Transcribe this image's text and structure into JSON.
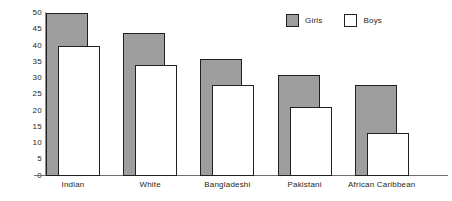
{
  "chart_data": {
    "type": "bar",
    "title": "",
    "xlabel": "",
    "ylabel": "Percentages",
    "ylim": [
      0,
      50
    ],
    "yticks": [
      0,
      5,
      10,
      15,
      20,
      25,
      30,
      35,
      40,
      45,
      50
    ],
    "grid": false,
    "legend_position": "top-right",
    "categories": [
      "Indian",
      "White",
      "Bangladeshi",
      "Pakistani",
      "African Caribbean"
    ],
    "series": [
      {
        "name": "Girls",
        "color": "#9e9e9e",
        "values": [
          50,
          44,
          36,
          31,
          28
        ]
      },
      {
        "name": "Boys",
        "color": "#ffffff",
        "values": [
          40,
          34,
          28,
          21,
          13
        ]
      }
    ]
  },
  "axis": {
    "y_label": "Percentages",
    "y_ticks": [
      "50",
      "45",
      "40",
      "35",
      "30",
      "25",
      "20",
      "15",
      "10",
      "5",
      "0"
    ]
  },
  "legend": {
    "items": [
      {
        "label": "Girls",
        "swatch": "gray-filled-square"
      },
      {
        "label": "Boys",
        "swatch": "white-outlined-square"
      }
    ]
  },
  "categories": [
    "Indian",
    "White",
    "Bangladeshi",
    "Pakistani",
    "African Caribbean"
  ]
}
